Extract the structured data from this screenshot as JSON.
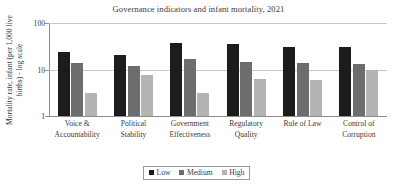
{
  "chart_data": {
    "type": "bar",
    "title": "Governance indicators and infant mortality, 2021",
    "xlabel": "",
    "ylabel": "Mortality rate, infant (per 1,000 live births) - log scale",
    "ylabel_lines": [
      "Mortality rate, infant (per 1,000 live",
      "births) - log scale"
    ],
    "yscale": "log",
    "ylim": [
      1,
      100
    ],
    "ytick_labels": [
      "100",
      "10",
      "1"
    ],
    "ytick_values": [
      100,
      10,
      1
    ],
    "grid": true,
    "legend_position": "bottom",
    "categories": [
      "Voice & Accountability",
      "Political Stability",
      "Government Effectiveness",
      "Regulatory Quality",
      "Rule of Law",
      "Control of Corruption"
    ],
    "category_lines": [
      [
        "Voice &",
        "Accountability"
      ],
      [
        "Political",
        "Stability"
      ],
      [
        "Government",
        "Effectiveness"
      ],
      [
        "Regulatory",
        "Quality"
      ],
      [
        "Rule of Law",
        ""
      ],
      [
        "Control of",
        "Corruption"
      ]
    ],
    "series": [
      {
        "name": "Low",
        "color": "#1c1c1c",
        "values": [
          24.0,
          20.5,
          37.0,
          36.0,
          31.0,
          30.0
        ]
      },
      {
        "name": "Medium",
        "color": "#6d6d6d",
        "values": [
          14.0,
          12.0,
          17.0,
          14.5,
          13.5,
          13.0
        ]
      },
      {
        "name": "High",
        "color": "#b4b4b4",
        "values": [
          3.1,
          7.5,
          3.1,
          6.2,
          5.9,
          9.6
        ]
      }
    ]
  },
  "legend": {
    "items": [
      {
        "label": "Low"
      },
      {
        "label": "Medium"
      },
      {
        "label": "High"
      }
    ]
  }
}
